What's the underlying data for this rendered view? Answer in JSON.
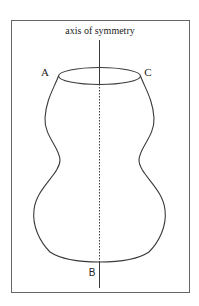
{
  "diagram": {
    "title": "axis of symmetry",
    "labels": {
      "A": "A",
      "B": "B",
      "C": "C"
    },
    "colors": {
      "line": "#3a3a3a",
      "frame": "#555555",
      "background": "#ffffff"
    }
  }
}
